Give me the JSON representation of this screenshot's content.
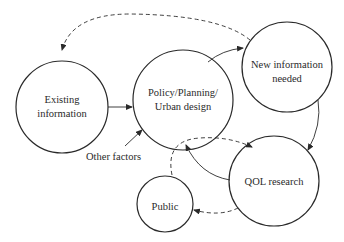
{
  "diagram": {
    "type": "flow-cycle",
    "colors": {
      "stroke": "#2a2a2a",
      "text": "#2a2a2a",
      "background": "#ffffff"
    },
    "nodes": [
      {
        "id": "existing",
        "lines": [
          "Existing",
          "information"
        ]
      },
      {
        "id": "policy",
        "lines": [
          "Policy/Planning/",
          "Urban design"
        ]
      },
      {
        "id": "newinfo",
        "lines": [
          "New information",
          "needed"
        ]
      },
      {
        "id": "qol",
        "lines": [
          "QOL research"
        ]
      },
      {
        "id": "public",
        "lines": [
          "Public"
        ]
      }
    ],
    "annotations": {
      "other_factors": "Other factors"
    },
    "edges": [
      {
        "from": "existing",
        "to": "policy",
        "style": "solid"
      },
      {
        "from": "policy",
        "to": "newinfo",
        "style": "solid"
      },
      {
        "from": "newinfo",
        "to": "qol",
        "style": "solid"
      },
      {
        "from": "qol",
        "to": "policy",
        "style": "solid"
      },
      {
        "from": "newinfo",
        "to": "existing",
        "style": "dashed"
      },
      {
        "from": "policy",
        "to": "qol",
        "style": "dashed"
      },
      {
        "from": "qol",
        "to": "public",
        "style": "dashed"
      },
      {
        "from": "public",
        "to": "policy",
        "style": "dashed"
      },
      {
        "from": "other_factors",
        "to": "policy",
        "style": "solid"
      }
    ]
  }
}
